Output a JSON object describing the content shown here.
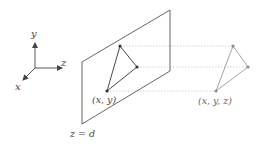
{
  "figure": {
    "axes": {
      "y_label": "y",
      "z_label": "z",
      "x_label": "x"
    },
    "image_plane": {
      "label": "z = d"
    },
    "projected_point": {
      "label": "(x, y)"
    },
    "original_point": {
      "label": "(x, y, z)"
    },
    "colors": {
      "ink": "#444444",
      "faded": "#9a9a9a",
      "projector": "#c8c8c8"
    }
  }
}
